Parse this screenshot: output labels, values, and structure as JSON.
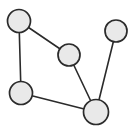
{
  "figure": {
    "kind": "undirected-node-link-graph",
    "width": 138,
    "height": 129,
    "background_color": "#ffffff"
  },
  "style": {
    "node_fill": "#e9e9e9",
    "node_stroke": "#2b2b2b",
    "node_stroke_width": 1.7,
    "edge_stroke": "#2b2b2b",
    "edge_stroke_width": 1.6
  },
  "graph": {
    "node_count": 5,
    "edge_count": 5,
    "nodes": [
      {
        "id": "n1",
        "label": "",
        "cx": 19,
        "cy": 21,
        "r": 11.5,
        "position": "top-left"
      },
      {
        "id": "n2",
        "label": "",
        "cx": 69,
        "cy": 55,
        "r": 11.0,
        "position": "center"
      },
      {
        "id": "n3",
        "label": "",
        "cx": 116,
        "cy": 31,
        "r": 11.0,
        "position": "top-right"
      },
      {
        "id": "n4",
        "label": "",
        "cx": 21,
        "cy": 93,
        "r": 11.5,
        "position": "bottom-left"
      },
      {
        "id": "n5",
        "label": "",
        "cx": 96,
        "cy": 112,
        "r": 12.5,
        "position": "bottom-right"
      }
    ],
    "edges": [
      {
        "id": "e1",
        "source": "n1",
        "target": "n2"
      },
      {
        "id": "e2",
        "source": "n1",
        "target": "n4"
      },
      {
        "id": "e3",
        "source": "n2",
        "target": "n5"
      },
      {
        "id": "e4",
        "source": "n4",
        "target": "n5"
      },
      {
        "id": "e5",
        "source": "n3",
        "target": "n5"
      }
    ]
  }
}
